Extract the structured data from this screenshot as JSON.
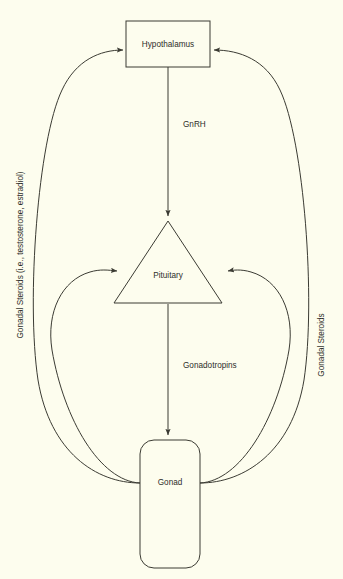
{
  "diagram": {
    "background_color": "#fdfdee",
    "line_color": "#3b3b33",
    "text_color": "#2e2e2a",
    "nodes": [
      {
        "id": "hypothalamus",
        "label": "Hypothalamus",
        "shape": "rectangle"
      },
      {
        "id": "pituitary",
        "label": "Pituitary",
        "shape": "triangle"
      },
      {
        "id": "gonad",
        "label": "Gonad",
        "shape": "rounded-rectangle"
      }
    ],
    "edges": [
      {
        "id": "gnrh",
        "label": "GnRH",
        "from": "hypothalamus",
        "to": "pituitary",
        "style": "straight-arrow"
      },
      {
        "id": "gonadotropins",
        "label": "Gonadotropins",
        "from": "pituitary",
        "to": "gonad",
        "style": "straight-arrow"
      },
      {
        "id": "feedback-left-long",
        "label": "Gonadal Steroids (i.e., testosterone, estradiol)",
        "from": "gonad",
        "to": "hypothalamus",
        "style": "curved-arrow"
      },
      {
        "id": "feedback-left-short",
        "label": "",
        "from": "gonad",
        "to": "pituitary",
        "style": "curved-arrow"
      },
      {
        "id": "feedback-right-long",
        "label": "Gonadal Steroids",
        "from": "gonad",
        "to": "hypothalamus",
        "style": "curved-arrow"
      },
      {
        "id": "feedback-right-short",
        "label": "",
        "from": "gonad",
        "to": "pituitary",
        "style": "curved-arrow"
      }
    ],
    "side_labels": {
      "left": "Gonadal Steroids (i.e., testosterone, estradiol)",
      "right": "Gonadal Steroids"
    }
  }
}
